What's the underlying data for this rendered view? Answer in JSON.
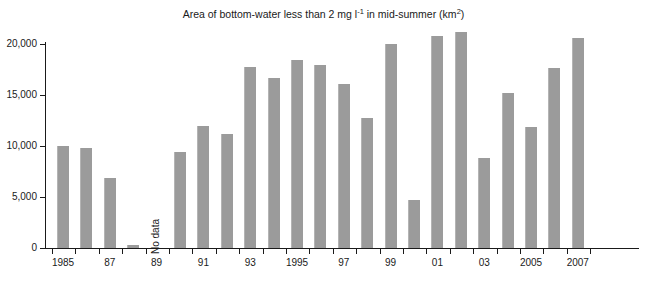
{
  "chart_data": {
    "type": "bar",
    "title_parts": {
      "pre": "Area of bottom-water less than 2 mg l",
      "sup1": "-1",
      "mid": " in mid-summer (km",
      "sup2": "2",
      "post": ")"
    },
    "xlabel": "",
    "ylabel": "",
    "ylim": [
      0,
      22000
    ],
    "grid": false,
    "legend": "none",
    "bar_color": "#9b9b9b",
    "axis_color": "#1a1a1a",
    "categories": [
      "1985",
      "1986",
      "1987",
      "1988",
      "1989",
      "1990",
      "1991",
      "1992",
      "1993",
      "1994",
      "1995",
      "1996",
      "1997",
      "1998",
      "1999",
      "2000",
      "2001",
      "2002",
      "2003",
      "2004",
      "2005",
      "2006",
      "2007"
    ],
    "values": [
      10000,
      9800,
      6900,
      250,
      null,
      9400,
      12000,
      11200,
      17700,
      16700,
      18400,
      17900,
      16100,
      12700,
      20000,
      4700,
      20800,
      21200,
      8800,
      15200,
      11900,
      17600,
      20600
    ],
    "annotations": [
      {
        "text": "No data",
        "category": "1989",
        "rotation": -90
      }
    ],
    "y_ticks": [
      0,
      5000,
      10000,
      15000,
      20000
    ],
    "y_tick_labels": [
      "0",
      "5,000",
      "10,000",
      "15,000",
      "20,000"
    ],
    "x_tick_labels": [
      {
        "category": "1985",
        "label": "1985"
      },
      {
        "category": "1987",
        "label": "87"
      },
      {
        "category": "1989",
        "label": "89"
      },
      {
        "category": "1991",
        "label": "91"
      },
      {
        "category": "1993",
        "label": "93"
      },
      {
        "category": "1995",
        "label": "1995"
      },
      {
        "category": "1997",
        "label": "97"
      },
      {
        "category": "1999",
        "label": "99"
      },
      {
        "category": "2001",
        "label": "01"
      },
      {
        "category": "2003",
        "label": "03"
      },
      {
        "category": "2005",
        "label": "2005"
      },
      {
        "category": "2007",
        "label": "2007"
      }
    ]
  }
}
